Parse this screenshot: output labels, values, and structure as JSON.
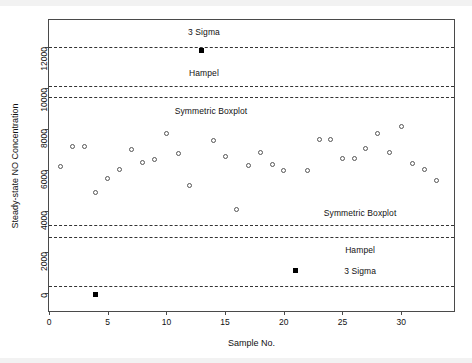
{
  "chart_data": {
    "type": "scatter",
    "title": "",
    "xlabel": "Sample No.",
    "ylabel": "Steady-state NO Concentration",
    "xlim": [
      0,
      34.5
    ],
    "ylim": [
      -900,
      13300
    ],
    "xticks": [
      0,
      5,
      10,
      15,
      20,
      25,
      30
    ],
    "xticklabels": [
      "0",
      "5",
      "10",
      "15",
      "20",
      "25",
      "30"
    ],
    "yticks": [
      0,
      2000,
      4000,
      6000,
      8000,
      10000,
      12000
    ],
    "yticklabels": [
      "0",
      "2000",
      "4000",
      "6000",
      "8000",
      "10000",
      "12000"
    ],
    "grid": false,
    "legend": "none",
    "series": [
      {
        "name": "inliers",
        "marker": "open-circle",
        "x": [
          1,
          2,
          3,
          4,
          5,
          6,
          7,
          8,
          9,
          10,
          11,
          12,
          14,
          15,
          16,
          17,
          18,
          19,
          20,
          22,
          23,
          24,
          25,
          26,
          27,
          28,
          29,
          30,
          31,
          32,
          33
        ],
        "y": [
          6150,
          7150,
          7150,
          4900,
          5550,
          6000,
          7000,
          6350,
          6500,
          7750,
          6800,
          5200,
          7400,
          6650,
          4050,
          6200,
          6850,
          6250,
          5950,
          5950,
          7450,
          7450,
          6550,
          6550,
          7050,
          7750,
          6850,
          8100,
          6300,
          6000,
          5450
        ]
      },
      {
        "name": "outliers",
        "marker": "filled-square",
        "x": [
          4,
          13,
          21
        ],
        "y": [
          -100,
          11800,
          1100
        ]
      }
    ],
    "reference_lines": [
      {
        "label": "3 Sigma",
        "value": 12000,
        "side": "upper",
        "style": "dashed"
      },
      {
        "label": "Hampel",
        "value": 10100,
        "side": "upper",
        "style": "dashed"
      },
      {
        "label": "Symmetric Boxplot",
        "value": 9550,
        "side": "upper",
        "style": "dashed"
      },
      {
        "label": "Symmetric Boxplot",
        "value": 3300,
        "side": "lower",
        "style": "dashed"
      },
      {
        "label": "Hampel",
        "value": 2700,
        "side": "lower",
        "style": "dashed"
      },
      {
        "label": "3 Sigma",
        "value": 300,
        "side": "lower",
        "style": "dashed"
      }
    ],
    "annotations": [
      {
        "text": "3 Sigma",
        "x": 13.2,
        "y": 12700
      },
      {
        "text": "Hampel",
        "x": 13.2,
        "y": 10700
      },
      {
        "text": "Symmetric Boxplot",
        "x": 13.8,
        "y": 8850
      },
      {
        "text": "Symmetric Boxplot",
        "x": 26.5,
        "y": 3900
      },
      {
        "text": "Hampel",
        "x": 26.5,
        "y": 2100
      },
      {
        "text": "3 Sigma",
        "x": 26.5,
        "y": 1050
      }
    ]
  }
}
